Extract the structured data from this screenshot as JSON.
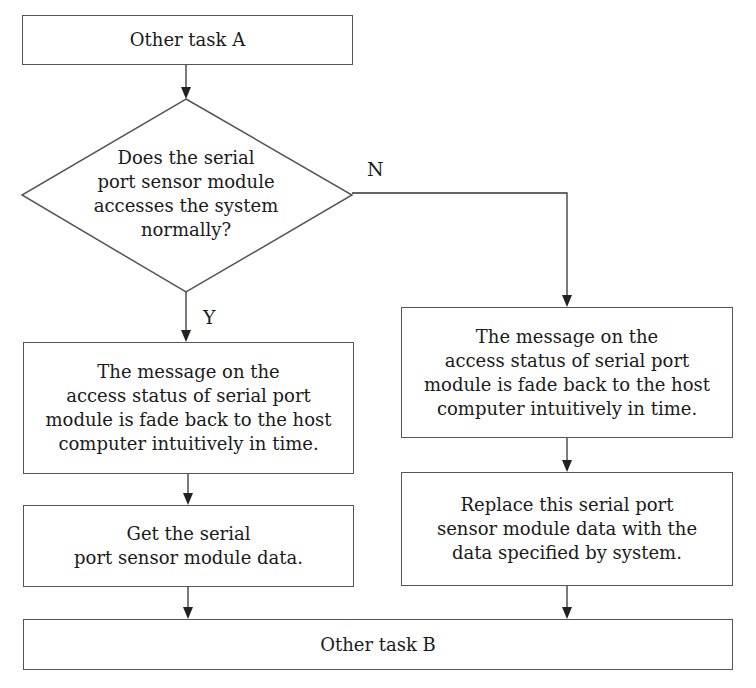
{
  "flowchart": {
    "start": {
      "label": "Other task A"
    },
    "decision": {
      "lines": [
        "Does the serial",
        "port sensor module",
        "accesses the system",
        "normally?"
      ]
    },
    "branch_yes": {
      "label": "Y"
    },
    "branch_no": {
      "label": "N"
    },
    "yes_step1": {
      "lines": [
        "The message on the",
        "access status of serial port",
        "module is fade back to the host",
        "computer intuitively in time."
      ]
    },
    "yes_step2": {
      "lines": [
        "Get the serial",
        "port sensor module data."
      ]
    },
    "no_step1": {
      "lines": [
        "The message on the",
        "access status of serial port",
        "module is fade back to the host",
        "computer intuitively in time."
      ]
    },
    "no_step2": {
      "lines": [
        "Replace this serial port",
        "sensor module data with the",
        "data specified by system."
      ]
    },
    "end": {
      "label": "Other task B"
    }
  }
}
